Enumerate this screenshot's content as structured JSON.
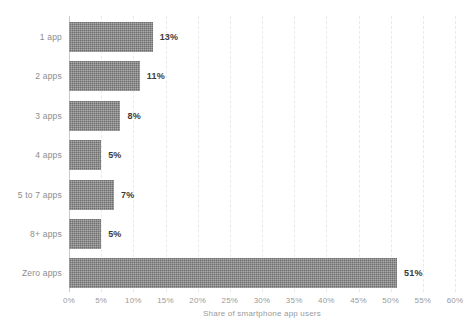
{
  "chart_data": {
    "type": "bar",
    "orientation": "horizontal",
    "title": "",
    "subtitle": "",
    "xlabel": "Share of smartphone app users",
    "ylabel": "",
    "categories": [
      "1 app",
      "2 apps",
      "3 apps",
      "4 apps",
      "5 to 7 apps",
      "8+ apps",
      "Zero apps"
    ],
    "values": [
      13,
      11,
      8,
      5,
      7,
      5,
      51
    ],
    "value_labels": [
      "13%",
      "11%",
      "8%",
      "5%",
      "7%",
      "5%",
      "51%"
    ],
    "xlim": [
      0,
      60
    ],
    "xtick_values": [
      0,
      5,
      10,
      15,
      20,
      25,
      30,
      35,
      40,
      45,
      50,
      55,
      60
    ],
    "xtick_labels": [
      "0%",
      "5%",
      "10%",
      "15%",
      "20%",
      "25%",
      "30%",
      "35%",
      "40%",
      "45%",
      "50%",
      "55%",
      "60%"
    ],
    "grid": "vertical-dashed",
    "legend": "none",
    "series": [
      {
        "name": "Share of smartphone app users",
        "values": [
          13,
          11,
          8,
          5,
          7,
          5,
          51
        ]
      }
    ],
    "colors": {
      "bar_fill": "#6f6f6f",
      "background": "#ffffff",
      "gridline": "#e9e9e9",
      "axis_line": "#c9c9c9",
      "category_label": "#8c8c8c",
      "tick_label": "#9a9a9a",
      "value_label": "#3b3b3b"
    }
  }
}
